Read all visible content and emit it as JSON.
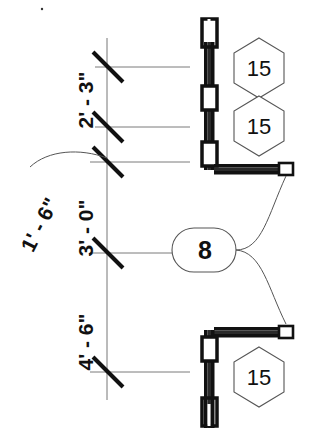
{
  "drawing": {
    "type": "architectural-plan-detail",
    "title": "Wall and door jamb dimension detail",
    "background_color": "#ffffff",
    "line_color": "#111111",
    "thin_line_color": "#666666",
    "dimension_string_x": 107,
    "dimensions": [
      {
        "id": "dim-2-3",
        "label": "2' - 3\"",
        "tick_y": 67,
        "text_x": 80,
        "text_y": 100,
        "rotated": true
      },
      {
        "id": "dim-1-6",
        "label": "1' - 6\"",
        "tick_y": 127,
        "text_x": 36,
        "text_y": 228,
        "rotated": true,
        "has_leader": true
      },
      {
        "id": "dim-3-0",
        "label": "3' - 0\"",
        "tick_y": 162,
        "text_x": 82,
        "text_y": 228,
        "rotated": true
      },
      {
        "id": "dim-4-6",
        "label": "4' - 6\"",
        "tick_y": 253,
        "text_x": 82,
        "text_y": 345,
        "rotated": true
      },
      {
        "id": "dim-end",
        "label": "",
        "tick_y": 372,
        "text_x": 0,
        "text_y": 0,
        "rotated": true
      }
    ],
    "extension_lines": [
      {
        "id": "ext-line-1",
        "y": 67,
        "x1": 95,
        "x2": 190
      },
      {
        "id": "ext-line-2",
        "y": 127,
        "x1": 95,
        "x2": 190
      },
      {
        "id": "ext-line-3",
        "y": 162,
        "x1": 90,
        "x2": 190
      },
      {
        "id": "ext-line-4",
        "y": 253,
        "x1": 90,
        "x2": 178
      },
      {
        "id": "ext-line-5",
        "y": 372,
        "x1": 90,
        "x2": 190
      }
    ],
    "callouts": [
      {
        "id": "hex-callout-top",
        "shape": "hexagon",
        "label": "15",
        "cx": 259,
        "cy": 68
      },
      {
        "id": "hex-callout-mid",
        "shape": "hexagon",
        "label": "15",
        "cx": 259,
        "cy": 126
      },
      {
        "id": "hex-callout-bottom",
        "shape": "hexagon",
        "label": "15",
        "cx": 259,
        "cy": 377
      },
      {
        "id": "pill-callout-8",
        "shape": "stadium",
        "label": "8",
        "cx": 205,
        "cy": 248
      }
    ],
    "walls": [
      {
        "id": "wall-vertical-upper",
        "orientation": "vertical",
        "x": 209,
        "y1": 20,
        "y2": 170
      },
      {
        "id": "wall-horizontal-upper",
        "orientation": "horizontal",
        "y": 168,
        "x1": 209,
        "x2": 292
      },
      {
        "id": "wall-horizontal-lower",
        "orientation": "horizontal",
        "y": 331,
        "x1": 209,
        "x2": 292
      },
      {
        "id": "wall-vertical-lower",
        "orientation": "vertical",
        "x": 209,
        "y1": 331,
        "y2": 428
      }
    ],
    "posts": [
      {
        "id": "post-channel-top",
        "type": "channel",
        "cx": 209,
        "cy": 33
      },
      {
        "id": "post-hollow-upper",
        "type": "hollow",
        "cx": 209,
        "cy": 98
      },
      {
        "id": "post-hollow-corner-upper",
        "type": "hollow",
        "cx": 209,
        "cy": 155
      },
      {
        "id": "post-hollow-corner-lower",
        "type": "hollow",
        "cx": 209,
        "cy": 348
      },
      {
        "id": "post-channel-bottom",
        "type": "channel",
        "cx": 209,
        "cy": 412
      }
    ],
    "end_caps": [
      {
        "id": "end-cap-upper",
        "cx": 287,
        "cy": 168
      },
      {
        "id": "end-cap-lower",
        "cx": 287,
        "cy": 331
      }
    ],
    "leaders": [
      {
        "id": "leader-8-to-upper-cap",
        "from": "pill-callout-8",
        "to": "end-cap-upper"
      },
      {
        "id": "leader-8-to-lower-cap",
        "from": "pill-callout-8",
        "to": "end-cap-lower"
      },
      {
        "id": "leader-1-6-to-dim",
        "from": "dim-1-6",
        "to": "dimension-line"
      }
    ]
  }
}
